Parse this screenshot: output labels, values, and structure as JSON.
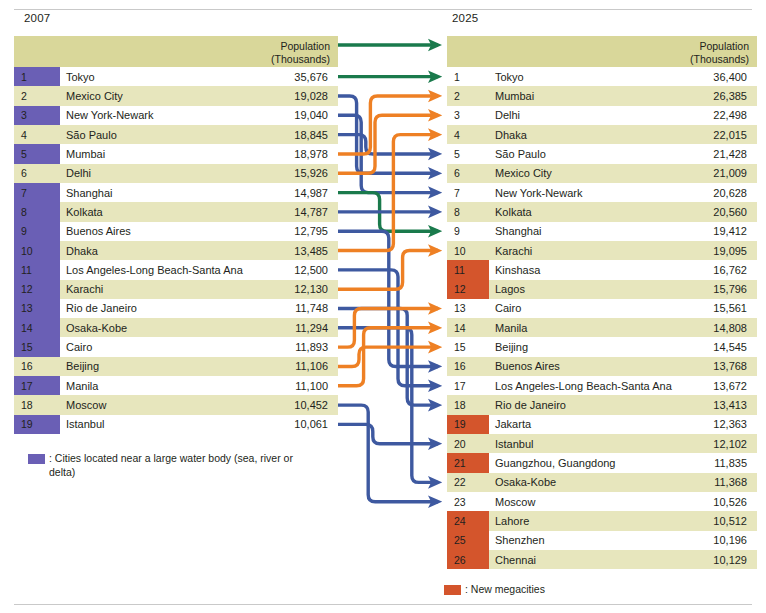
{
  "years": {
    "left": "2007",
    "right": "2025"
  },
  "header": {
    "population_line1": "Population",
    "population_line2": "(Thousands)"
  },
  "legends": {
    "water": ": Cities located near a large water body (sea, river or delta)",
    "new": ": New megacities"
  },
  "colors": {
    "water_body": "#6a5fb5",
    "new_megacity": "#d4552c",
    "header_band": "#d9d79a",
    "row_alt": "#e7e6bd",
    "link_blue": "#3e59a0",
    "link_orange": "#ee8024",
    "link_green": "#1a7a4c"
  },
  "chart_data": {
    "type": "table",
    "columns": [
      "Rank",
      "City",
      "Population (Thousands)"
    ],
    "left": {
      "year": "2007",
      "rows": [
        {
          "rank": "1",
          "city": "Tokyo",
          "pop": "35,676",
          "water": true
        },
        {
          "rank": "2",
          "city": "Mexico City",
          "pop": "19,028",
          "water": false
        },
        {
          "rank": "3",
          "city": "New York-Newark",
          "pop": "19,040",
          "water": true
        },
        {
          "rank": "4",
          "city": "São Paulo",
          "pop": "18,845",
          "water": false
        },
        {
          "rank": "5",
          "city": "Mumbai",
          "pop": "18,978",
          "water": true
        },
        {
          "rank": "6",
          "city": "Delhi",
          "pop": "15,926",
          "water": false
        },
        {
          "rank": "7",
          "city": "Shanghai",
          "pop": "14,987",
          "water": true
        },
        {
          "rank": "8",
          "city": "Kolkata",
          "pop": "14,787",
          "water": true
        },
        {
          "rank": "9",
          "city": "Buenos Aires",
          "pop": "12,795",
          "water": true
        },
        {
          "rank": "10",
          "city": "Dhaka",
          "pop": "13,485",
          "water": true
        },
        {
          "rank": "11",
          "city": "Los Angeles-Long Beach-Santa Ana",
          "pop": "12,500",
          "water": true
        },
        {
          "rank": "12",
          "city": "Karachi",
          "pop": "12,130",
          "water": true
        },
        {
          "rank": "13",
          "city": "Rio de Janeiro",
          "pop": "11,748",
          "water": true
        },
        {
          "rank": "14",
          "city": "Osaka-Kobe",
          "pop": "11,294",
          "water": true
        },
        {
          "rank": "15",
          "city": "Cairo",
          "pop": "11,893",
          "water": true
        },
        {
          "rank": "16",
          "city": "Beijing",
          "pop": "11,106",
          "water": false
        },
        {
          "rank": "17",
          "city": "Manila",
          "pop": "11,100",
          "water": true
        },
        {
          "rank": "18",
          "city": "Moscow",
          "pop": "10,452",
          "water": false
        },
        {
          "rank": "19",
          "city": "Istanbul",
          "pop": "10,061",
          "water": true
        }
      ]
    },
    "right": {
      "year": "2025",
      "rows": [
        {
          "rank": "1",
          "city": "Tokyo",
          "pop": "36,400",
          "new": false
        },
        {
          "rank": "2",
          "city": "Mumbai",
          "pop": "26,385",
          "new": false
        },
        {
          "rank": "3",
          "city": "Delhi",
          "pop": "22,498",
          "new": false
        },
        {
          "rank": "4",
          "city": "Dhaka",
          "pop": "22,015",
          "new": false
        },
        {
          "rank": "5",
          "city": "São Paulo",
          "pop": "21,428",
          "new": false
        },
        {
          "rank": "6",
          "city": "Mexico City",
          "pop": "21,009",
          "new": false
        },
        {
          "rank": "7",
          "city": "New York-Newark",
          "pop": "20,628",
          "new": false
        },
        {
          "rank": "8",
          "city": "Kolkata",
          "pop": "20,560",
          "new": false
        },
        {
          "rank": "9",
          "city": "Shanghai",
          "pop": "19,412",
          "new": false
        },
        {
          "rank": "10",
          "city": "Karachi",
          "pop": "19,095",
          "new": false
        },
        {
          "rank": "11",
          "city": "Kinshasa",
          "pop": "16,762",
          "new": true
        },
        {
          "rank": "12",
          "city": "Lagos",
          "pop": "15,796",
          "new": true
        },
        {
          "rank": "13",
          "city": "Cairo",
          "pop": "15,561",
          "new": false
        },
        {
          "rank": "14",
          "city": "Manila",
          "pop": "14,808",
          "new": false
        },
        {
          "rank": "15",
          "city": "Beijing",
          "pop": "14,545",
          "new": false
        },
        {
          "rank": "16",
          "city": "Buenos Aires",
          "pop": "13,768",
          "new": false
        },
        {
          "rank": "17",
          "city": "Los Angeles-Long Beach-Santa Ana",
          "pop": "13,672",
          "new": false
        },
        {
          "rank": "18",
          "city": "Rio de Janeiro",
          "pop": "13,413",
          "new": false
        },
        {
          "rank": "19",
          "city": "Jakarta",
          "pop": "12,363",
          "new": true
        },
        {
          "rank": "20",
          "city": "Istanbul",
          "pop": "12,102",
          "new": false
        },
        {
          "rank": "21",
          "city": "Guangzhou, Guangdong",
          "pop": "11,835",
          "new": true
        },
        {
          "rank": "22",
          "city": "Osaka-Kobe",
          "pop": "11,368",
          "new": false
        },
        {
          "rank": "23",
          "city": "Moscow",
          "pop": "10,526",
          "new": false
        },
        {
          "rank": "24",
          "city": "Lahore",
          "pop": "10,512",
          "new": true
        },
        {
          "rank": "25",
          "city": "Shenzhen",
          "pop": "10,196",
          "new": true
        },
        {
          "rank": "26",
          "city": "Chennai",
          "pop": "10,129",
          "new": true
        }
      ]
    },
    "links": [
      {
        "from": "header",
        "to": "header",
        "color": "green",
        "note": "header connector"
      },
      {
        "from": 1,
        "to": 1,
        "color": "green"
      },
      {
        "from": 2,
        "to": 6,
        "color": "blue"
      },
      {
        "from": 3,
        "to": 7,
        "color": "blue"
      },
      {
        "from": 4,
        "to": 5,
        "color": "blue"
      },
      {
        "from": 5,
        "to": 2,
        "color": "orange"
      },
      {
        "from": 6,
        "to": 3,
        "color": "orange"
      },
      {
        "from": 7,
        "to": 9,
        "color": "green"
      },
      {
        "from": 8,
        "to": 8,
        "color": "blue"
      },
      {
        "from": 9,
        "to": 16,
        "color": "blue"
      },
      {
        "from": 10,
        "to": 4,
        "color": "orange"
      },
      {
        "from": 11,
        "to": 17,
        "color": "blue"
      },
      {
        "from": 12,
        "to": 10,
        "color": "orange"
      },
      {
        "from": 13,
        "to": 18,
        "color": "blue"
      },
      {
        "from": 14,
        "to": 22,
        "color": "blue"
      },
      {
        "from": 15,
        "to": 13,
        "color": "orange"
      },
      {
        "from": 16,
        "to": 15,
        "color": "orange"
      },
      {
        "from": 17,
        "to": 14,
        "color": "orange"
      },
      {
        "from": 18,
        "to": 23,
        "color": "blue"
      },
      {
        "from": 19,
        "to": 20,
        "color": "blue"
      }
    ]
  }
}
